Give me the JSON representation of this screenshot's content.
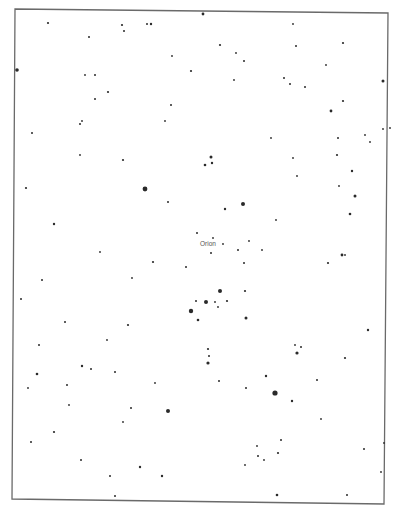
{
  "chart_data": {
    "type": "scatter",
    "title": "",
    "subtitle": "",
    "xlabel": "",
    "ylabel": "",
    "grid": false,
    "legend": null,
    "annotations": [
      {
        "text": "Orion",
        "x": 200,
        "y": 246
      }
    ],
    "frame": {
      "points": [
        [
          15,
          9
        ],
        [
          388,
          13
        ],
        [
          384,
          504
        ],
        [
          12,
          499
        ]
      ],
      "color": "#6a6a6a"
    },
    "star_color": "#2a2a2a",
    "stars": [
      {
        "x": 48,
        "y": 23,
        "r": 1.1
      },
      {
        "x": 122,
        "y": 25,
        "r": 1.1
      },
      {
        "x": 124,
        "y": 31,
        "r": 1.0
      },
      {
        "x": 147,
        "y": 24,
        "r": 1.0
      },
      {
        "x": 151,
        "y": 24,
        "r": 1.2
      },
      {
        "x": 89,
        "y": 37,
        "r": 1.0
      },
      {
        "x": 17,
        "y": 70,
        "r": 1.8
      },
      {
        "x": 85,
        "y": 75,
        "r": 0.9
      },
      {
        "x": 95,
        "y": 75,
        "r": 1.0
      },
      {
        "x": 108,
        "y": 92,
        "r": 1.1
      },
      {
        "x": 172,
        "y": 56,
        "r": 0.9
      },
      {
        "x": 191,
        "y": 71,
        "r": 1.1
      },
      {
        "x": 95,
        "y": 99,
        "r": 1.0
      },
      {
        "x": 171,
        "y": 105,
        "r": 1.0
      },
      {
        "x": 82,
        "y": 121,
        "r": 0.9
      },
      {
        "x": 80,
        "y": 124,
        "r": 1.0
      },
      {
        "x": 165,
        "y": 121,
        "r": 0.9
      },
      {
        "x": 203,
        "y": 14,
        "r": 1.4
      },
      {
        "x": 293,
        "y": 24,
        "r": 0.9
      },
      {
        "x": 220,
        "y": 45,
        "r": 1.1
      },
      {
        "x": 296,
        "y": 46,
        "r": 1.0
      },
      {
        "x": 343,
        "y": 43,
        "r": 1.1
      },
      {
        "x": 236,
        "y": 53,
        "r": 0.9
      },
      {
        "x": 244,
        "y": 61,
        "r": 1.0
      },
      {
        "x": 326,
        "y": 65,
        "r": 0.9
      },
      {
        "x": 234,
        "y": 80,
        "r": 0.9
      },
      {
        "x": 284,
        "y": 78,
        "r": 1.0
      },
      {
        "x": 290,
        "y": 84,
        "r": 1.0
      },
      {
        "x": 305,
        "y": 87,
        "r": 1.0
      },
      {
        "x": 383,
        "y": 81,
        "r": 1.5
      },
      {
        "x": 343,
        "y": 101,
        "r": 1.1
      },
      {
        "x": 331,
        "y": 111,
        "r": 1.4
      },
      {
        "x": 390,
        "y": 128,
        "r": 0.9
      },
      {
        "x": 32,
        "y": 133,
        "r": 1.0
      },
      {
        "x": 80,
        "y": 155,
        "r": 0.9
      },
      {
        "x": 123,
        "y": 160,
        "r": 1.1
      },
      {
        "x": 26,
        "y": 188,
        "r": 1.1
      },
      {
        "x": 145,
        "y": 189,
        "r": 2.4
      },
      {
        "x": 168,
        "y": 202,
        "r": 1.0
      },
      {
        "x": 54,
        "y": 224,
        "r": 1.2
      },
      {
        "x": 197,
        "y": 233,
        "r": 1.0
      },
      {
        "x": 271,
        "y": 138,
        "r": 0.9
      },
      {
        "x": 338,
        "y": 138,
        "r": 1.0
      },
      {
        "x": 365,
        "y": 135,
        "r": 0.9
      },
      {
        "x": 370,
        "y": 142,
        "r": 0.9
      },
      {
        "x": 383,
        "y": 129,
        "r": 0.9
      },
      {
        "x": 211,
        "y": 157,
        "r": 1.5
      },
      {
        "x": 212,
        "y": 163,
        "r": 1.2
      },
      {
        "x": 205,
        "y": 165,
        "r": 1.3
      },
      {
        "x": 293,
        "y": 158,
        "r": 0.9
      },
      {
        "x": 337,
        "y": 155,
        "r": 1.1
      },
      {
        "x": 352,
        "y": 171,
        "r": 1.2
      },
      {
        "x": 297,
        "y": 176,
        "r": 0.9
      },
      {
        "x": 339,
        "y": 186,
        "r": 0.9
      },
      {
        "x": 243,
        "y": 204,
        "r": 2.0
      },
      {
        "x": 225,
        "y": 209,
        "r": 1.2
      },
      {
        "x": 355,
        "y": 196,
        "r": 1.5
      },
      {
        "x": 276,
        "y": 220,
        "r": 0.9
      },
      {
        "x": 350,
        "y": 214,
        "r": 1.3
      },
      {
        "x": 213,
        "y": 238,
        "r": 0.9
      },
      {
        "x": 223,
        "y": 244,
        "r": 0.9
      },
      {
        "x": 249,
        "y": 241,
        "r": 0.9
      },
      {
        "x": 238,
        "y": 250,
        "r": 1.0
      },
      {
        "x": 262,
        "y": 250,
        "r": 0.9
      },
      {
        "x": 211,
        "y": 253,
        "r": 1.0
      },
      {
        "x": 244,
        "y": 263,
        "r": 1.0
      },
      {
        "x": 328,
        "y": 263,
        "r": 1.1
      },
      {
        "x": 342,
        "y": 255,
        "r": 1.4
      },
      {
        "x": 345,
        "y": 255,
        "r": 0.9
      },
      {
        "x": 100,
        "y": 252,
        "r": 0.9
      },
      {
        "x": 153,
        "y": 262,
        "r": 1.1
      },
      {
        "x": 186,
        "y": 267,
        "r": 1.0
      },
      {
        "x": 42,
        "y": 280,
        "r": 1.0
      },
      {
        "x": 132,
        "y": 278,
        "r": 0.9
      },
      {
        "x": 21,
        "y": 299,
        "r": 1.0
      },
      {
        "x": 65,
        "y": 322,
        "r": 1.0
      },
      {
        "x": 128,
        "y": 325,
        "r": 1.1
      },
      {
        "x": 107,
        "y": 340,
        "r": 0.9
      },
      {
        "x": 39,
        "y": 345,
        "r": 1.0
      },
      {
        "x": 82,
        "y": 366,
        "r": 1.2
      },
      {
        "x": 91,
        "y": 369,
        "r": 1.0
      },
      {
        "x": 115,
        "y": 372,
        "r": 1.0
      },
      {
        "x": 37,
        "y": 374,
        "r": 1.3
      },
      {
        "x": 220,
        "y": 291,
        "r": 2.0
      },
      {
        "x": 206,
        "y": 302,
        "r": 2.0
      },
      {
        "x": 215,
        "y": 302,
        "r": 0.9
      },
      {
        "x": 227,
        "y": 301,
        "r": 1.1
      },
      {
        "x": 245,
        "y": 291,
        "r": 1.1
      },
      {
        "x": 218,
        "y": 307,
        "r": 0.9
      },
      {
        "x": 246,
        "y": 318,
        "r": 1.5
      },
      {
        "x": 191,
        "y": 311,
        "r": 2.2
      },
      {
        "x": 196,
        "y": 301,
        "r": 1.0
      },
      {
        "x": 198,
        "y": 320,
        "r": 1.3
      },
      {
        "x": 368,
        "y": 330,
        "r": 1.2
      },
      {
        "x": 208,
        "y": 349,
        "r": 1.1
      },
      {
        "x": 209,
        "y": 356,
        "r": 1.0
      },
      {
        "x": 208,
        "y": 363,
        "r": 1.6
      },
      {
        "x": 295,
        "y": 345,
        "r": 0.9
      },
      {
        "x": 301,
        "y": 347,
        "r": 1.0
      },
      {
        "x": 297,
        "y": 353,
        "r": 1.6
      },
      {
        "x": 345,
        "y": 358,
        "r": 1.1
      },
      {
        "x": 266,
        "y": 376,
        "r": 1.2
      },
      {
        "x": 28,
        "y": 388,
        "r": 0.9
      },
      {
        "x": 67,
        "y": 385,
        "r": 1.0
      },
      {
        "x": 69,
        "y": 405,
        "r": 0.9
      },
      {
        "x": 131,
        "y": 408,
        "r": 1.0
      },
      {
        "x": 123,
        "y": 422,
        "r": 0.9
      },
      {
        "x": 54,
        "y": 432,
        "r": 1.1
      },
      {
        "x": 31,
        "y": 442,
        "r": 1.0
      },
      {
        "x": 81,
        "y": 460,
        "r": 1.0
      },
      {
        "x": 140,
        "y": 467,
        "r": 1.2
      },
      {
        "x": 110,
        "y": 476,
        "r": 1.0
      },
      {
        "x": 162,
        "y": 476,
        "r": 1.2
      },
      {
        "x": 168,
        "y": 411,
        "r": 2.0
      },
      {
        "x": 155,
        "y": 383,
        "r": 0.9
      },
      {
        "x": 115,
        "y": 496,
        "r": 1.0
      },
      {
        "x": 219,
        "y": 381,
        "r": 1.0
      },
      {
        "x": 246,
        "y": 388,
        "r": 1.0
      },
      {
        "x": 275,
        "y": 393,
        "r": 2.6
      },
      {
        "x": 292,
        "y": 401,
        "r": 1.2
      },
      {
        "x": 317,
        "y": 380,
        "r": 1.0
      },
      {
        "x": 321,
        "y": 419,
        "r": 0.9
      },
      {
        "x": 281,
        "y": 440,
        "r": 1.0
      },
      {
        "x": 257,
        "y": 446,
        "r": 0.9
      },
      {
        "x": 258,
        "y": 456,
        "r": 1.0
      },
      {
        "x": 278,
        "y": 453,
        "r": 1.1
      },
      {
        "x": 264,
        "y": 460,
        "r": 0.9
      },
      {
        "x": 245,
        "y": 465,
        "r": 0.9
      },
      {
        "x": 277,
        "y": 495,
        "r": 1.3
      },
      {
        "x": 347,
        "y": 495,
        "r": 1.0
      },
      {
        "x": 381,
        "y": 472,
        "r": 0.9
      },
      {
        "x": 384,
        "y": 443,
        "r": 0.9
      },
      {
        "x": 364,
        "y": 449,
        "r": 1.0
      }
    ]
  }
}
